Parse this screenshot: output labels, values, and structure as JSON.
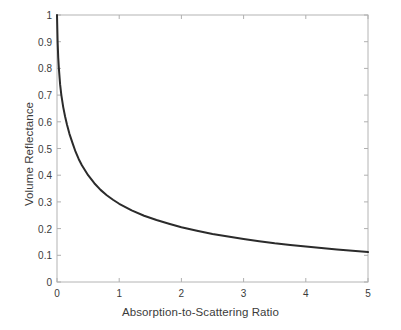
{
  "chart_data": {
    "type": "line",
    "title": "",
    "xlabel": "Absorption-to-Scattering Ratio",
    "ylabel": "Volume Reflectance",
    "xlim": [
      0,
      5
    ],
    "ylim": [
      0,
      1
    ],
    "grid": false,
    "legend": null,
    "line_color": "#2b2b2b",
    "line_width": 2,
    "axis_color": "#b0b0b0",
    "text_color": "#3b3b3b",
    "background_color": "#ffffff",
    "xticks": [
      0,
      1,
      2,
      3,
      4,
      5
    ],
    "xticklabels": [
      "0",
      "1",
      "2",
      "3",
      "4",
      "5"
    ],
    "yticks": [
      0,
      0.1,
      0.2,
      0.3,
      0.4,
      0.5,
      0.6,
      0.7,
      0.8,
      0.9,
      1
    ],
    "yticklabels": [
      "0",
      "0.1",
      "0.2",
      "0.3",
      "0.4",
      "0.5",
      "0.6",
      "0.7",
      "0.8",
      "0.9",
      "1"
    ],
    "series": [
      {
        "name": "Volume Reflectance",
        "x": [
          0,
          0.01,
          0.02,
          0.03,
          0.05,
          0.07,
          0.1,
          0.13,
          0.16,
          0.2,
          0.25,
          0.3,
          0.35,
          0.4,
          0.5,
          0.6,
          0.7,
          0.8,
          0.9,
          1.0,
          1.2,
          1.4,
          1.6,
          1.8,
          2.0,
          2.25,
          2.5,
          2.75,
          3.0,
          3.25,
          3.5,
          3.75,
          4.0,
          4.25,
          4.5,
          4.75,
          5.0
        ],
        "y": [
          1.0,
          0.9,
          0.84,
          0.8,
          0.74,
          0.7,
          0.655,
          0.62,
          0.59,
          0.555,
          0.52,
          0.487,
          0.46,
          0.437,
          0.4,
          0.37,
          0.345,
          0.325,
          0.308,
          0.293,
          0.268,
          0.248,
          0.232,
          0.218,
          0.205,
          0.192,
          0.18,
          0.17,
          0.161,
          0.153,
          0.145,
          0.139,
          0.133,
          0.127,
          0.122,
          0.117,
          0.112
        ]
      }
    ]
  },
  "axes": {
    "x_title": "Absorption-to-Scattering Ratio",
    "y_title": "Volume Reflectance"
  }
}
